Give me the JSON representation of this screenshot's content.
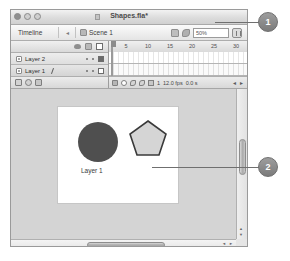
{
  "window": {
    "title": "Shapes.fla*",
    "controls": [
      "close",
      "minimize",
      "zoom"
    ]
  },
  "timeline_bar": {
    "label": "Timeline",
    "collapse_icon": "chevron-left-icon",
    "scene_icon": "scene-icon",
    "scene_label": "Scene 1",
    "edit_scene_icon": "edit-scene-icon",
    "edit_symbol_icon": "edit-symbol-icon",
    "zoom_value": "50%",
    "panel_menu_icon": "panel-menu-icon"
  },
  "layers_panel": {
    "header_icons": [
      "eye-icon",
      "lock-icon",
      "outline-icon"
    ],
    "layers": [
      {
        "name": "Layer 2",
        "type_icon": "layer-icon",
        "selected": false,
        "editing": false,
        "outline_filled": true
      },
      {
        "name": "Layer 1",
        "type_icon": "layer-icon",
        "selected": true,
        "editing": true,
        "outline_filled": false
      }
    ],
    "toolbar_icons": [
      "new-layer-icon",
      "new-folder-icon",
      "motion-guide-icon"
    ]
  },
  "ruler": {
    "ticks": [
      "5",
      "10",
      "15",
      "20",
      "25",
      "30"
    ]
  },
  "timeline_status": {
    "icons": [
      "delete-layer-icon",
      "center-frame-icon",
      "onion-skin-icon",
      "onion-outline-icon",
      "edit-multiple-icon"
    ],
    "current_frame": "1",
    "fps": "12.0 fps",
    "elapsed": "0.0 s",
    "nav_prev": "◄",
    "nav_next": "►"
  },
  "stage": {
    "circle": {
      "name": "circle-shape",
      "color": "#4f4f4f"
    },
    "pentagon": {
      "name": "pentagon-shape",
      "fill": "#d5d5d5",
      "stroke": "#3a3a3a"
    },
    "label": "Layer 1"
  },
  "scrollbars": {
    "vertical_thumb": "vertical-scroll-thumb",
    "horizontal_thumb": "horizontal-scroll-thumb",
    "up_arrow": "▲",
    "down_arrow": "▼",
    "left_arrow": "◄",
    "right_arrow": "►"
  },
  "callouts": [
    {
      "number": "1"
    },
    {
      "number": "2"
    }
  ]
}
